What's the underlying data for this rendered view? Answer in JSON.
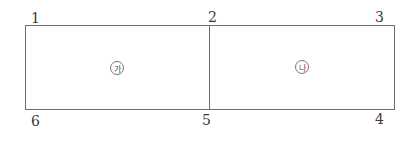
{
  "diagram": {
    "type": "adjacent-rectangles",
    "vertices": [
      {
        "id": "1",
        "label": "1"
      },
      {
        "id": "2",
        "label": "2"
      },
      {
        "id": "3",
        "label": "3"
      },
      {
        "id": "4",
        "label": "4"
      },
      {
        "id": "5",
        "label": "5"
      },
      {
        "id": "6",
        "label": "6"
      }
    ],
    "regions": [
      {
        "id": "ga",
        "label": "가",
        "symbol": "㉮",
        "bounded_by": [
          "1",
          "2",
          "5",
          "6"
        ]
      },
      {
        "id": "na",
        "label": "나",
        "symbol": "㉯",
        "bounded_by": [
          "2",
          "3",
          "4",
          "5"
        ]
      }
    ],
    "edges": [
      [
        "1",
        "2"
      ],
      [
        "2",
        "3"
      ],
      [
        "3",
        "4"
      ],
      [
        "4",
        "5"
      ],
      [
        "5",
        "6"
      ],
      [
        "6",
        "1"
      ],
      [
        "2",
        "5"
      ]
    ],
    "line_color": "#6e6e6e"
  }
}
